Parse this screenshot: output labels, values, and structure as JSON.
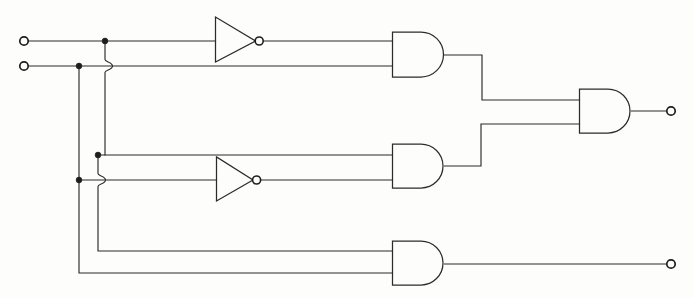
{
  "diagram": {
    "type": "digital-logic-schematic",
    "background_color": "#fdfdfc",
    "line_color": "#2b2b2b",
    "line_width": 1.15
  },
  "inputs": [
    {
      "id": "in1",
      "name": "input-terminal-1",
      "x": 24,
      "y": 41,
      "radius": 4.2
    },
    {
      "id": "in2",
      "name": "input-terminal-2",
      "x": 24,
      "y": 66,
      "radius": 4.2
    }
  ],
  "outputs": [
    {
      "id": "out1",
      "name": "output-terminal-1",
      "x": 671,
      "y": 111,
      "radius": 4.2
    },
    {
      "id": "out2",
      "name": "output-terminal-2",
      "x": 671,
      "y": 264,
      "radius": 4.2
    }
  ],
  "gates": [
    {
      "id": "not1",
      "name": "inverter-top",
      "kind": "NOT",
      "x": 215,
      "y": 17,
      "width": 41,
      "height": 45,
      "bubble_r": 4.0
    },
    {
      "id": "not2",
      "name": "inverter-middle",
      "kind": "NOT",
      "x": 216,
      "y": 157,
      "width": 38,
      "height": 44,
      "bubble_r": 4.0
    },
    {
      "id": "and1",
      "name": "and-gate-top",
      "kind": "AND",
      "x": 392,
      "y": 32,
      "width": 52,
      "height": 45
    },
    {
      "id": "and2",
      "name": "and-gate-middle",
      "kind": "AND",
      "x": 392,
      "y": 144,
      "width": 52,
      "height": 44
    },
    {
      "id": "and3",
      "name": "and-gate-bottom",
      "kind": "AND",
      "x": 392,
      "y": 241,
      "width": 52,
      "height": 44
    },
    {
      "id": "and4",
      "name": "and-gate-output",
      "kind": "AND",
      "x": 579,
      "y": 89,
      "width": 52,
      "height": 44
    }
  ],
  "junctions": [
    {
      "name": "junction-input1-tap",
      "x": 105,
      "y": 41,
      "radius": 2.9
    },
    {
      "name": "junction-input2-tap",
      "x": 79,
      "y": 66,
      "radius": 2.9
    },
    {
      "name": "junction-mid-upper-tap",
      "x": 98,
      "y": 155,
      "radius": 2.9
    },
    {
      "name": "junction-mid-lower-tap",
      "x": 79,
      "y": 180,
      "radius": 2.9
    }
  ],
  "wire_hops": [
    {
      "name": "wire-hop-upper",
      "x": 112,
      "y": 66,
      "radius": 7
    },
    {
      "name": "wire-hop-lower",
      "x": 105,
      "y": 180,
      "radius": 7
    }
  ],
  "nets": {
    "input1_main": "M28,41 H215",
    "input2_main": "M28,66 H392",
    "not1_out": "M263,41 H392",
    "input1_drop": "M105,41 V59",
    "input1_drop_cont": "M105,73 V155",
    "input1_mid_seg": "M98,155 H216",
    "input1_drop_low": "M105,187 V251 H392",
    "input2_drop": "M79,66 V180",
    "input2_mid_seg": "M79,180 H216",
    "input2_drop_low": "M79,180 V273 H392",
    "not2_out": "M260,180 H392",
    "and1_out": "M444,55 H482 V100 H579",
    "and2_out": "M444,166 H481 V124 H579",
    "and3_out": "M444,264 H667",
    "and4_out": "M631,111 H667"
  },
  "labels": {
    "note": ""
  }
}
